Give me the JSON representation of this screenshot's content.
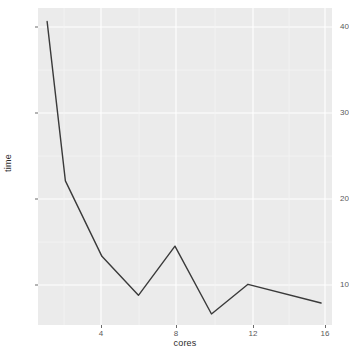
{
  "chart_data": {
    "type": "line",
    "title": "",
    "xlabel": "cores",
    "ylabel": "time",
    "x": [
      1,
      2,
      4,
      6,
      8,
      10,
      12,
      16
    ],
    "values": [
      41.0,
      22.2,
      13.3,
      8.7,
      14.5,
      6.5,
      10.0,
      7.8
    ],
    "series": [
      {
        "name": "time",
        "values": [
          41.0,
          22.2,
          13.3,
          8.7,
          14.5,
          6.5,
          10.0,
          7.8
        ]
      }
    ],
    "xlim": [
      0.5,
      16.6
    ],
    "ylim": [
      5.2,
      42.6
    ],
    "x_ticks": [
      4,
      8,
      12,
      16
    ],
    "x_tick_labels": [
      "4",
      "8",
      "12",
      "16"
    ],
    "y_ticks": [
      10,
      20,
      30,
      40
    ],
    "y_tick_labels": [
      "10",
      "20",
      "30",
      "40"
    ],
    "grid": true,
    "legend": "none",
    "panel_background": "#ebebeb",
    "grid_color": "#ffffff",
    "line_color": "#3a3a3a",
    "text_color": "#2b2b2b",
    "tick_label_color": "#5a5a5a"
  },
  "axes": {
    "y_title": "time",
    "x_title": "cores"
  }
}
